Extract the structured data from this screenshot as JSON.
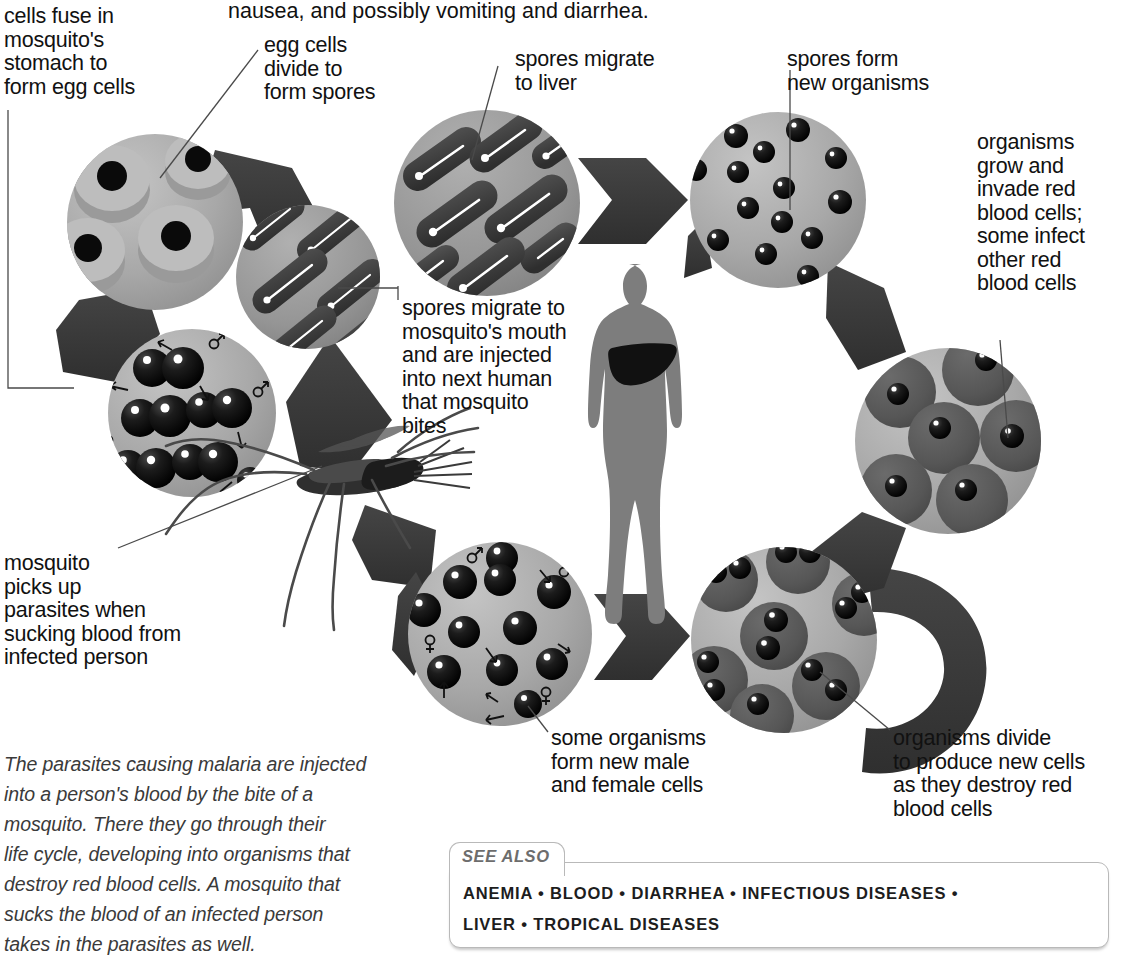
{
  "figure": {
    "top_text": "nausea, and possibly vomiting and diarrhea."
  },
  "labels": {
    "cells_fuse": "cells fuse in\nmosquito's\nstomach to\nform egg cells",
    "egg_cells_divide": "egg cells\ndivide to\nform spores",
    "spores_migrate_liver": "spores migrate\nto liver",
    "spores_form_new": "spores form\nnew organisms",
    "organisms_grow": "organisms\ngrow and\ninvade red\nblood cells;\nsome infect\nother red\nblood cells",
    "spores_migrate_mouth": "spores migrate to\nmosquito's mouth\nand are injected\ninto next human\nthat mosquito\nbites",
    "mosquito_picks_up": "mosquito\npicks up\nparasites when\nsucking blood from\ninfected person",
    "some_organisms": "some organisms\nform new male\nand female cells",
    "organisms_divide": "organisms divide\nto produce new cells\nas they destroy red\nblood cells"
  },
  "caption": {
    "text": "The parasites causing malaria are injected\ninto a person's blood by the bite of a\nmosquito. There they go through their\nlife cycle, developing into organisms that\ndestroy red blood cells. A mosquito that\nsucks the blood of an infected person\ntakes in the parasites as well."
  },
  "see_also": {
    "heading": "SEE ALSO",
    "line1": "ANEMIA • BLOOD • DIARRHEA • INFECTIOUS DISEASES •",
    "line2": "LIVER • TROPICAL DISEASES",
    "entries": [
      "ANEMIA",
      "BLOOD",
      "DIARRHEA",
      "INFECTIOUS DISEASES",
      "LIVER",
      "TROPICAL DISEASES"
    ]
  },
  "diagram": {
    "stages": [
      {
        "id": "egg-cells",
        "label_key": "cells_fuse",
        "content": "light disks with dark nuclei"
      },
      {
        "id": "spores-in-mosquito",
        "label_key": "egg_cells_divide",
        "content": "dark capsule spores"
      },
      {
        "id": "spores-mouth",
        "label_key": "spores_migrate_mouth",
        "content": "dark capsule spores"
      },
      {
        "id": "spores-liver",
        "label_key": "spores_migrate_liver",
        "content": "dark capsule spores"
      },
      {
        "id": "new-organisms",
        "label_key": "spores_form_new",
        "content": "small black spheres"
      },
      {
        "id": "invaded-cells",
        "label_key": "organisms_grow",
        "content": "gray blood cells with one parasite"
      },
      {
        "id": "dividing-cells",
        "label_key": "organisms_divide",
        "content": "gray blood cells with two parasites"
      },
      {
        "id": "male-female",
        "label_key": "some_organisms",
        "content": "black spheres with male and female symbols"
      },
      {
        "id": "fusing-cells",
        "label_key": "mosquito_picks_up",
        "content": "fusing paired black cells with sex symbols"
      }
    ],
    "human_figure": {
      "name": "human silhouette",
      "organ": "liver"
    },
    "insect": {
      "name": "mosquito"
    }
  },
  "colors": {
    "arrow": "#3b3b3b",
    "circle_light": "#a9a9a9",
    "circle_mid": "#8f8f8f",
    "cell_dark": "#5a5a5a",
    "parasite": "#0d0d0d",
    "human": "#7d7d7d",
    "liver": "#111111",
    "text": "#111111",
    "caption_text": "#3a3a3a",
    "box_border": "#b9b9b9",
    "see_also_heading": "#6d6d6d"
  }
}
